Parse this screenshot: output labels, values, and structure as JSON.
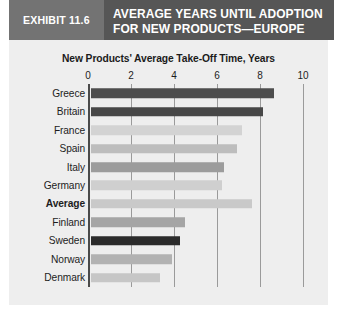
{
  "exhibit": {
    "tag": "EXHIBIT 11.6",
    "title_line1": "AVERAGE YEARS UNTIL ADOPTION",
    "title_line2": "FOR NEW PRODUCTS—EUROPE",
    "tag_bg": "#737373",
    "title_bg": "#565656"
  },
  "chart_data": {
    "type": "bar",
    "orientation": "horizontal",
    "title": "New Products' Average Take-Off Time, Years",
    "xlabel": "",
    "ylabel": "",
    "xlim": [
      0,
      10
    ],
    "xticks": [
      "0",
      "2",
      "4",
      "6",
      "8",
      "10"
    ],
    "xtick_values": [
      0,
      2,
      4,
      6,
      8,
      10
    ],
    "grid": true,
    "legend": "none",
    "categories": [
      "Greece",
      "Britain",
      "France",
      "Spain",
      "Italy",
      "Germany",
      "Average",
      "Finland",
      "Sweden",
      "Norway",
      "Denmark"
    ],
    "values": [
      8.5,
      8.0,
      7.0,
      6.8,
      6.2,
      6.1,
      7.5,
      4.35,
      4.15,
      3.75,
      3.2
    ],
    "bar_colors": [
      "#4d4d4d",
      "#474747",
      "#d3d3d3",
      "#bdbdbd",
      "#9c9c9c",
      "#cfcfcf",
      "#c9c9c9",
      "#a5a5a5",
      "#2b2b2b",
      "#b2b2b2",
      "#c6c6c6"
    ],
    "highlight_category": "Average",
    "background": "#eeeeee",
    "gridline_color": "#9a9a9a",
    "axis_color": "#4a4a4a"
  }
}
